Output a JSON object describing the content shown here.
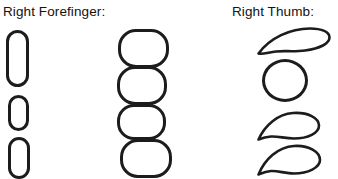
{
  "figure": {
    "background_color": "#ffffff",
    "stroke_color": "#1c1c1c",
    "labels": {
      "forefinger": "Right Forefinger:",
      "thumb": "Right Thumb:"
    },
    "columns": [
      {
        "name": "forefinger-narrow-column",
        "shape_kind": "vertical-stadium",
        "count": 3,
        "shapes": [
          {
            "name": "narrow-stadium-tall",
            "x": 6,
            "y": 30,
            "w": 23,
            "h": 57,
            "radius": 11.5
          },
          {
            "name": "narrow-stadium-small",
            "x": 8,
            "y": 95,
            "w": 21,
            "h": 36,
            "radius": 10.5
          },
          {
            "name": "narrow-stadium-medium",
            "x": 8,
            "y": 137,
            "w": 22,
            "h": 42,
            "radius": 11
          }
        ]
      },
      {
        "name": "forefinger-wide-column",
        "shape_kind": "wide-rounded-rect",
        "count": 4,
        "shapes": [
          {
            "name": "wide-rounded-rect-1",
            "x": 118,
            "y": 29,
            "w": 51,
            "h": 39,
            "radius": 18
          },
          {
            "name": "wide-rounded-rect-2",
            "x": 117,
            "y": 66,
            "w": 50,
            "h": 39,
            "radius": 18
          },
          {
            "name": "wide-rounded-rect-3",
            "x": 117,
            "y": 104,
            "w": 49,
            "h": 36,
            "radius": 17
          },
          {
            "name": "wide-rounded-rect-4",
            "x": 120,
            "y": 139,
            "w": 52,
            "h": 39,
            "radius": 18
          }
        ]
      },
      {
        "name": "thumb-column",
        "shape_kind": "mixed",
        "count": 4,
        "shapes": [
          {
            "name": "thumb-leaf-flat",
            "kind": "leaf-flat",
            "x": 258,
            "y": 28,
            "w": 70,
            "h": 26
          },
          {
            "name": "thumb-circle",
            "kind": "circle",
            "x": 262,
            "y": 59,
            "w": 46,
            "h": 43
          },
          {
            "name": "thumb-teardrop-1",
            "kind": "teardrop",
            "x": 258,
            "y": 112,
            "w": 62,
            "h": 29
          },
          {
            "name": "thumb-teardrop-2",
            "kind": "teardrop",
            "x": 258,
            "y": 145,
            "w": 62,
            "h": 31
          }
        ]
      }
    ],
    "caption_note": "Fingerprint pattern ridge-flow diagram: loop and whorl outline shapes"
  }
}
